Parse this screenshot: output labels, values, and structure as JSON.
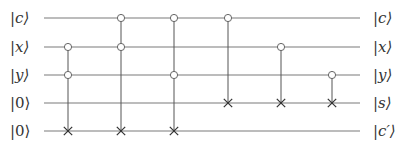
{
  "diagram": {
    "type": "quantum-circuit",
    "inputs": [
      {
        "label": "|c⟩",
        "var": "c"
      },
      {
        "label": "|x⟩",
        "var": "x"
      },
      {
        "label": "|y⟩",
        "var": "y"
      },
      {
        "label": "|0⟩",
        "var": "0"
      },
      {
        "label": "|0⟩",
        "var": "0"
      }
    ],
    "outputs": [
      {
        "label": "|c⟩",
        "var": "c"
      },
      {
        "label": "|x⟩",
        "var": "x"
      },
      {
        "label": "|y⟩",
        "var": "y"
      },
      {
        "label": "|s⟩",
        "var": "s"
      },
      {
        "label": "|c′⟩",
        "var": "c′"
      }
    ],
    "wire_y": [
      18,
      47,
      75,
      103,
      131
    ],
    "wire_x_start": 44,
    "wire_x_end": 360,
    "gates": [
      {
        "name": "toffoli-1",
        "x": 68,
        "controls": [
          1,
          2
        ],
        "target": 4
      },
      {
        "name": "toffoli-2",
        "x": 121,
        "controls": [
          0,
          1
        ],
        "target": 4
      },
      {
        "name": "toffoli-3",
        "x": 174,
        "controls": [
          0,
          2
        ],
        "target": 4
      },
      {
        "name": "cnot-1",
        "x": 228,
        "controls": [
          0
        ],
        "target": 3
      },
      {
        "name": "cnot-2",
        "x": 281,
        "controls": [
          1
        ],
        "target": 3
      },
      {
        "name": "cnot-3",
        "x": 332,
        "controls": [
          2
        ],
        "target": 3
      }
    ],
    "colors": {
      "wire": "#7a7a7a",
      "control_stroke": "#666666",
      "target_stroke": "#333333",
      "text": "#333333"
    }
  }
}
